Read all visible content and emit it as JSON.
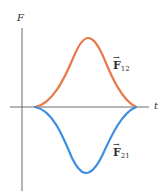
{
  "axes": {
    "y_label": "F",
    "x_label": "t"
  },
  "curves": [
    {
      "name": "F12",
      "label_base": "F",
      "label_sub": "12",
      "color": "#e8784a",
      "direction": "positive"
    },
    {
      "name": "F21",
      "label_base": "F",
      "label_sub": "21",
      "color": "#3d8ee0",
      "direction": "negative"
    }
  ],
  "colors": {
    "axis": "#6b6b6b",
    "text": "#333333"
  }
}
